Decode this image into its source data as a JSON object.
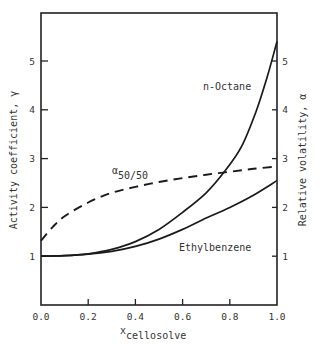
{
  "chart_data": {
    "type": "line",
    "title": "",
    "xlabel": "x",
    "xlabel_subscript": "cellosolve",
    "ylabel_left": "Activity coefficient, γ",
    "ylabel_right": "Relative volatility, α",
    "xlim": [
      0.0,
      1.0
    ],
    "ylim_left": [
      0,
      6
    ],
    "ylim_right": [
      0,
      6
    ],
    "grid": false,
    "legend": "inline annotations",
    "x_ticks": [
      "0.0",
      "0.2",
      "0.4",
      "0.6",
      "0.8",
      "1.0"
    ],
    "x_tick_values": [
      0.0,
      0.2,
      0.4,
      0.6,
      0.8,
      1.0
    ],
    "y_ticks_left": [
      "1",
      "2",
      "3",
      "4",
      "5"
    ],
    "y_ticks_right": [
      "1",
      "2",
      "3",
      "4",
      "5"
    ],
    "y_tick_values": [
      1,
      2,
      3,
      4,
      5
    ],
    "series": [
      {
        "name": "n-Octane",
        "axis": "left",
        "style": "solid",
        "x": [
          0.0,
          0.1,
          0.2,
          0.3,
          0.4,
          0.5,
          0.6,
          0.7,
          0.78,
          0.85,
          0.91,
          0.96,
          1.0
        ],
        "values": [
          1.0,
          1.01,
          1.05,
          1.14,
          1.3,
          1.55,
          1.9,
          2.3,
          2.75,
          3.25,
          3.95,
          4.7,
          5.4
        ]
      },
      {
        "name": "Ethylbenzene",
        "axis": "left",
        "style": "solid",
        "x": [
          0.0,
          0.1,
          0.2,
          0.3,
          0.4,
          0.5,
          0.6,
          0.7,
          0.8,
          0.9,
          1.0
        ],
        "values": [
          1.0,
          1.01,
          1.04,
          1.1,
          1.2,
          1.35,
          1.55,
          1.78,
          2.0,
          2.25,
          2.55
        ]
      },
      {
        "name": "α50/50",
        "axis": "right",
        "style": "dashed",
        "x": [
          0.0,
          0.05,
          0.1,
          0.2,
          0.3,
          0.4,
          0.5,
          0.6,
          0.7,
          0.8,
          0.9,
          1.0
        ],
        "values": [
          1.32,
          1.6,
          1.82,
          2.1,
          2.3,
          2.42,
          2.52,
          2.6,
          2.67,
          2.73,
          2.79,
          2.84
        ]
      }
    ],
    "annotations": [
      {
        "text": "n-Octane",
        "x": 0.82,
        "y": 4.4
      },
      {
        "text": "Ethylbenzene",
        "x": 0.72,
        "y": 1.18
      },
      {
        "text": "α",
        "subscript": "50/50",
        "x": 0.3,
        "y": 2.6
      }
    ]
  },
  "labels": {
    "ylabel_left": "Activity coefficient, γ",
    "ylabel_right": "Relative volatility, α",
    "xlabel_main": "x",
    "xlabel_sub": "cellosolve",
    "annot_octane": "n-Octane",
    "annot_ethyl": "Ethylbenzene",
    "annot_alpha": "α",
    "annot_alpha_sub": "50/50"
  }
}
